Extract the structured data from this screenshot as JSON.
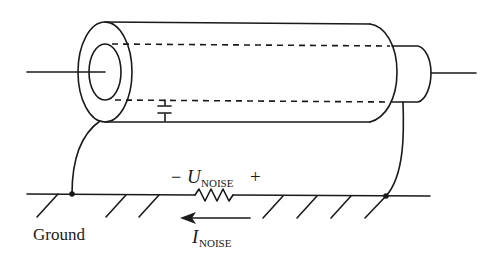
{
  "diagram": {
    "type": "coaxial-cable-ground-loop",
    "labels": {
      "ground": "Ground",
      "voltage_minus": "−",
      "voltage_symbol": "U",
      "voltage_subscript": "NOISE",
      "voltage_plus": "+",
      "current_symbol": "I",
      "current_subscript": "NOISE"
    },
    "components": {
      "cable": "coaxial-cable",
      "capacitor": "stray-capacitance",
      "resistor": "ground-resistance",
      "arrow": "noise-current-direction-left"
    },
    "colors": {
      "line": "#1a1a1a",
      "background": "#ffffff"
    }
  }
}
